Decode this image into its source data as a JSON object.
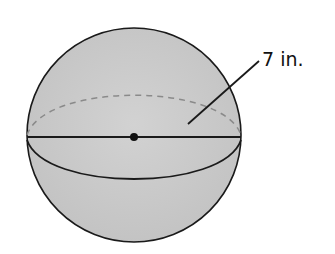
{
  "diagram": {
    "type": "sphere",
    "radius_label": "7 in.",
    "radius_value": 7,
    "radius_unit": "in.",
    "elements": {
      "sphere_outline": true,
      "equator_front_arc": "solid",
      "equator_back_arc": "dashed",
      "diameter_line": "solid",
      "center_point": "dot",
      "radius_leader_line": true
    }
  },
  "colors": {
    "sphere_fill": "#c9c9c9",
    "stroke": "#1a1a1a",
    "dashed_stroke": "#8a8a8a",
    "background": "#ffffff",
    "text": "#111111"
  }
}
